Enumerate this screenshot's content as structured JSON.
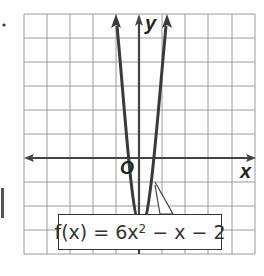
{
  "graph": {
    "axis_x_label": "x",
    "axis_y_label": "y",
    "origin_label": "O",
    "function_label": {
      "prefix": "f(x) = 6x",
      "exponent": "2",
      "suffix": " − x − 2"
    },
    "grid": {
      "columns": 10,
      "rows": 10
    },
    "colors": {
      "grid": "#9a9a9a",
      "curve": "#3a3a3a",
      "axis": "#444444"
    }
  }
}
